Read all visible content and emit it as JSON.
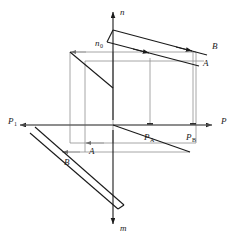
{
  "figure": {
    "kind": "descriptive-geometry-projection-diagram",
    "background_color": "#ffffff",
    "ink_color": "#1a1a1a",
    "construction_color": "#8f8f8f"
  },
  "axes": [
    {
      "id": "n",
      "label": "n",
      "direction": "up",
      "label_x": 120,
      "label_y": 15
    },
    {
      "id": "m",
      "label": "m",
      "direction": "down",
      "label_x": 120,
      "label_y": 231
    },
    {
      "id": "p",
      "label": "P",
      "direction": "right",
      "label_x": 221,
      "label_y": 124
    },
    {
      "id": "p1",
      "label": "P",
      "sub": "1",
      "direction": "left",
      "label_x": 8,
      "label_y": 124
    }
  ],
  "points": [
    {
      "id": "b-upper",
      "label": "B",
      "x": 212,
      "y": 49
    },
    {
      "id": "a-upper",
      "label": "A",
      "x": 203,
      "y": 66
    },
    {
      "id": "a-lower",
      "label": "A",
      "x": 89,
      "y": 154
    },
    {
      "id": "b-lower",
      "label": "B",
      "x": 64,
      "y": 165
    }
  ],
  "traces": [
    {
      "id": "n0",
      "label": "n",
      "sub": "0",
      "x": 95,
      "y": 46
    },
    {
      "id": "pa",
      "label": "P",
      "sub": "A",
      "x": 150,
      "y": 140
    },
    {
      "id": "pb",
      "label": "P",
      "sub": "B",
      "x": 192,
      "y": 140
    }
  ]
}
